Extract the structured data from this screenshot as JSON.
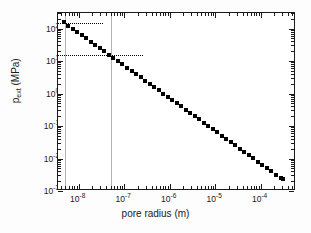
{
  "figure": {
    "background": "#ffffff",
    "frame_color": "#1a1a1a",
    "marker_color": "#000000",
    "guide_color": "#b4b4b4",
    "dotted_color": "#000000"
  },
  "chart_data": {
    "type": "scatter",
    "title": "",
    "xlabel": "pore radius (m)",
    "ylabel": "p_ext (MPa)",
    "ylabel_base": "p",
    "ylabel_sub": "ext",
    "ylabel_unit": " (MPa)",
    "xscale": "log",
    "yscale": "log",
    "xlim": [
      3.5e-09,
      0.0006
    ],
    "ylim": [
      0.001,
      300.0
    ],
    "grid": false,
    "legend": null,
    "xticks": [
      1e-08,
      1e-07,
      1e-06,
      1e-05,
      0.0001
    ],
    "xtick_labels": [
      "10-8",
      "10-7",
      "10-6",
      "10-5",
      "10-4"
    ],
    "xtick_mantissas": [
      "10",
      "10",
      "10",
      "10",
      "10"
    ],
    "xtick_exponents": [
      "-8",
      "-7",
      "-6",
      "-5",
      "-4"
    ],
    "yticks": [
      0.001,
      0.01,
      0.1,
      1.0,
      10.0,
      100.0
    ],
    "ytick_mantissas": [
      "10",
      "10",
      "10",
      "10",
      "10",
      "10"
    ],
    "ytick_exponents": [
      "-3",
      "-2",
      "-1",
      "0",
      "1",
      "2"
    ],
    "x": [
      4.7e-09,
      5.9e-09,
      7.4e-09,
      9.3e-09,
      1.17e-08,
      1.47e-08,
      1.85e-08,
      2.32e-08,
      2.92e-08,
      3.67e-08,
      4.61e-08,
      5.8e-08,
      7.29e-08,
      9.16e-08,
      1.15e-07,
      1.45e-07,
      1.82e-07,
      2.29e-07,
      2.87e-07,
      3.61e-07,
      4.54e-07,
      5.71e-07,
      7.17e-07,
      9.01e-07,
      1.13e-06,
      1.42e-06,
      1.79e-06,
      2.25e-06,
      2.83e-06,
      3.55e-06,
      4.47e-06,
      5.61e-06,
      7.06e-06,
      8.87e-06,
      1.11e-05,
      1.4e-05,
      1.76e-05,
      2.21e-05,
      2.78e-05,
      3.49e-05,
      4.39e-05,
      5.52e-05,
      6.93e-05,
      8.71e-05,
      0.00011,
      0.000138,
      0.000173,
      0.000218,
      0.000274,
      0.00031
    ],
    "y": [
      155.0,
      123.0,
      98.0,
      78.0,
      62.0,
      49.5,
      39.3,
      31.3,
      24.9,
      19.8,
      15.7,
      12.5,
      9.95,
      7.91,
      6.29,
      5.0,
      3.98,
      3.16,
      2.51,
      2.0,
      1.59,
      1.26,
      1.0,
      0.795,
      0.632,
      0.502,
      0.399,
      0.317,
      0.252,
      0.2,
      0.159,
      0.126,
      0.1,
      0.0796,
      0.0633,
      0.0503,
      0.04,
      0.0318,
      0.0252,
      0.0201,
      0.0159,
      0.0127,
      0.0101,
      0.008,
      0.00636,
      0.00505,
      0.00402,
      0.00319,
      0.00254,
      0.0024
    ],
    "annotations": {
      "vertical_guides": [
        {
          "name": "guide-line-left",
          "x": 4.9e-09
        },
        {
          "name": "guide-line-right",
          "x": 5e-08
        }
      ],
      "horizontal_guides": [
        {
          "name": "dotted-line-upper",
          "y": 145.0,
          "x_end": 3.5e-08
        },
        {
          "name": "dotted-line-lower",
          "y": 15.0,
          "x_end": 2.6e-07
        }
      ]
    }
  }
}
